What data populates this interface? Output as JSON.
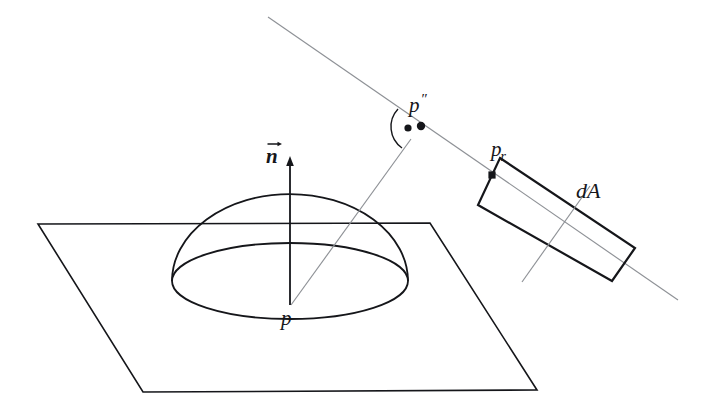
{
  "figure": {
    "background_color": "#ffffff",
    "ink_color": "#15161a",
    "thin_ray_color": "#8e9196",
    "width": 706,
    "height": 414
  },
  "labels": {
    "normal_vector": "n",
    "surface_point": "p",
    "hemisphere_point": "p",
    "hemisphere_point_primes": "″",
    "receiver_point": "p",
    "receiver_point_subscript": "r",
    "differential_area": "dA"
  },
  "elements": {
    "plane": {
      "name": "ground-plane",
      "shape": "parallelogram",
      "points": "38,224 430,223 537,390 143,392"
    },
    "hemisphere": {
      "name": "hemisphere",
      "dome_top_y": 194,
      "base_center_x": 290,
      "base_center_y": 281,
      "base_rx": 118,
      "base_ry": 38
    },
    "normal_arrow": {
      "name": "normal-arrow",
      "from_x": 290,
      "from_y": 305,
      "to_x": 290,
      "to_y": 159
    },
    "ray": {
      "name": "incident-ray",
      "from_x": 291,
      "from_y": 305,
      "to_x": 411,
      "to_y": 139
    },
    "long_line": {
      "name": "direction-line",
      "from_x": 268,
      "from_y": 17,
      "to_x": 678,
      "to_y": 300
    },
    "dA_patch": {
      "name": "differential-area-patch",
      "points": "500,158 635,248 612,281 478,205"
    },
    "dA_cross_line": {
      "name": "patch-cross-line",
      "from_x": 590,
      "from_y": 186,
      "to_x": 522,
      "to_y": 282
    },
    "angle_arc": {
      "name": "angle-arc",
      "center_x": 420,
      "center_y": 126,
      "radius": 26
    },
    "markers": [
      {
        "name": "angle-dot",
        "x": 408,
        "y": 128
      },
      {
        "name": "point-p-double-prime",
        "x": 421,
        "y": 126
      },
      {
        "name": "point-p-r",
        "x": 492,
        "y": 175
      }
    ]
  },
  "label_positions": {
    "normal_vector": {
      "x": 266,
      "y": 141
    },
    "surface_point": {
      "x": 281,
      "y": 308
    },
    "hemisphere_point": {
      "x": 409,
      "y": 92
    },
    "receiver_point": {
      "x": 491,
      "y": 139
    },
    "differential_area": {
      "x": 576,
      "y": 180
    }
  }
}
